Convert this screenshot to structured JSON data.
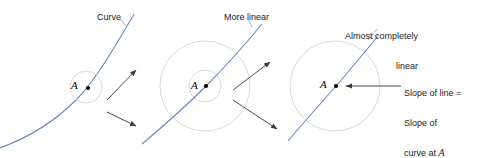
{
  "figure": {
    "width": 477,
    "height": 158,
    "background": "#ffffff"
  },
  "colors": {
    "curve": "#6b87b8",
    "circle": "#d8d8dc",
    "arrow": "#4d4d4d",
    "text": "#1a1a1a",
    "point": "#000000"
  },
  "panels": [
    {
      "id": "panel-1",
      "label": "Curve",
      "point_label": "A",
      "circles": [
        {
          "cx": 86,
          "cy": 87,
          "r": 16
        }
      ],
      "point": {
        "x": 88,
        "y": 88
      },
      "curvature": "strongly curved"
    },
    {
      "id": "panel-2",
      "label": "More linear",
      "point_label": "A",
      "circles": [
        {
          "cx": 205,
          "cy": 86,
          "r": 45
        },
        {
          "cx": 205,
          "cy": 86,
          "r": 16
        }
      ],
      "point": {
        "x": 206,
        "y": 86
      },
      "curvature": "slightly curved"
    },
    {
      "id": "panel-3",
      "label_line1": "Almost completely",
      "label_line2": "linear",
      "point_label": "A",
      "circles": [
        {
          "cx": 335,
          "cy": 86,
          "r": 45
        }
      ],
      "point": {
        "x": 336,
        "y": 86
      },
      "curvature": "nearly straight"
    }
  ],
  "annotations": {
    "slope_line1": "Slope of line =",
    "slope_line2": "Slope of",
    "slope_line3_prefix": "curve at ",
    "slope_line3_var": "A"
  },
  "arrows": [
    {
      "name": "zoom-arrow-upper-left",
      "from": [
        107,
        100
      ],
      "to": [
        138,
        68
      ]
    },
    {
      "name": "zoom-arrow-lower-left",
      "from": [
        107,
        112
      ],
      "to": [
        138,
        128
      ]
    },
    {
      "name": "zoom-arrow-upper-right",
      "from": [
        233,
        90
      ],
      "to": [
        272,
        60
      ]
    },
    {
      "name": "zoom-arrow-lower-right",
      "from": [
        233,
        100
      ],
      "to": [
        279,
        131
      ]
    },
    {
      "name": "slope-leader-arrow",
      "from": [
        400,
        86
      ],
      "to": [
        345,
        86
      ]
    }
  ]
}
